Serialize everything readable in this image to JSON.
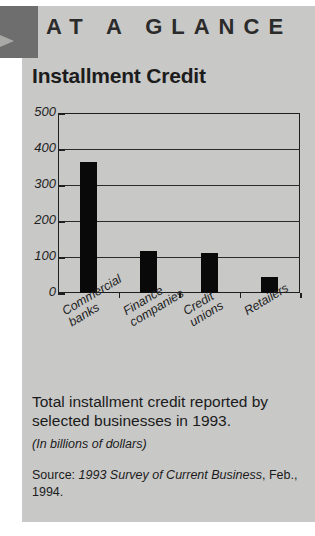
{
  "header": {
    "banner_text": "AT A GLANCE",
    "arrow_icon": "triangle-right-icon",
    "block_color": "#6e6e6e",
    "band_color": "#c8c8c7"
  },
  "chart_title": "Installment Credit",
  "chart_data": {
    "type": "bar",
    "title": "Installment Credit",
    "categories": [
      "Commercial\nbanks",
      "Finance\ncompanies",
      "Credit\nunions",
      "Retailers"
    ],
    "category_labels": [
      {
        "line1": "Commercial",
        "line2": "banks"
      },
      {
        "line1": "Finance",
        "line2": "companies"
      },
      {
        "line1": "Credit",
        "line2": "unions"
      },
      {
        "line1": "Retailers",
        "line2": ""
      }
    ],
    "values": [
      365,
      118,
      110,
      45
    ],
    "xlabel": "",
    "ylabel": "",
    "ylim": [
      0,
      500
    ],
    "yticks": [
      0,
      100,
      200,
      300,
      400,
      500
    ],
    "ytick_labels": [
      "0",
      "100",
      "200",
      "300",
      "400",
      "500"
    ],
    "grid": true,
    "legend": "none",
    "bar_color": "#090909",
    "units": "billions of dollars"
  },
  "caption": "Total installment credit reported by selected businesses in 1993.",
  "subnote": "(In billions of dollars)",
  "source": {
    "prefix": "Source: ",
    "italic_part": "1993 Survey of Current Business",
    "suffix": ", Feb., 1994."
  }
}
